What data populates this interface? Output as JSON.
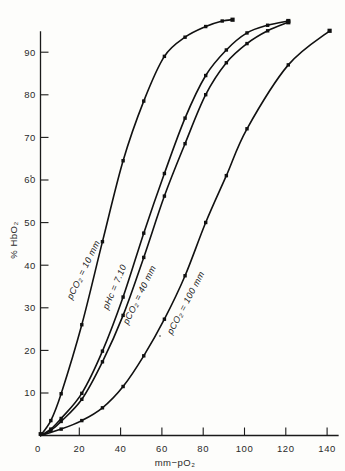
{
  "chart_data": {
    "type": "line",
    "title": "",
    "xlabel": "mm−pO₂",
    "ylabel": "% HbO₂",
    "xlim": [
      0,
      145
    ],
    "ylim": [
      0,
      100
    ],
    "xticks": [
      0,
      20,
      40,
      60,
      80,
      100,
      120,
      140
    ],
    "xtick_labels": [
      "0",
      "20",
      "40",
      "60",
      "80",
      "100",
      "120",
      "140"
    ],
    "yticks": [
      10,
      20,
      30,
      40,
      50,
      60,
      70,
      80,
      90
    ],
    "ytick_labels": [
      "10",
      "20",
      "30",
      "40",
      "50",
      "60",
      "70",
      "80",
      "90"
    ],
    "grid": false,
    "legend_position": "inline-curve-labels",
    "marker": "filled-square",
    "series": [
      {
        "name": "pCO2 = 10 mm",
        "label": "pCO₂ = 10 mm",
        "x": [
          0,
          5,
          10,
          20,
          30,
          40,
          50,
          60,
          70,
          80,
          88,
          93
        ],
        "y": [
          0,
          3.5,
          9.8,
          26.0,
          45.5,
          64.5,
          78.5,
          89.0,
          93.5,
          96.0,
          97.3,
          97.6
        ]
      },
      {
        "name": "pHc = 7.10",
        "label": "pHc = 7.10",
        "x": [
          0,
          5,
          10,
          20,
          30,
          40,
          50,
          60,
          70,
          80,
          90,
          100,
          110,
          120
        ],
        "y": [
          0,
          1.5,
          4.0,
          9.9,
          19.8,
          32.5,
          47.5,
          61.5,
          74.5,
          84.5,
          90.5,
          94.5,
          96.3,
          97.3
        ]
      },
      {
        "name": "pCO2 = 40 mm",
        "label": "pCO₂ = 40 mm",
        "x": [
          0,
          5,
          10,
          20,
          30,
          40,
          50,
          60,
          70,
          80,
          90,
          100,
          110,
          120
        ],
        "y": [
          0,
          1.2,
          3.3,
          8.5,
          17.3,
          28.2,
          41.8,
          56.2,
          68.5,
          80.0,
          87.5,
          92.0,
          95.0,
          97.0
        ]
      },
      {
        "name": "pCO2 = 100 mm",
        "label": "pCO₂ = 100 mm",
        "x": [
          0,
          10,
          20,
          30,
          40,
          50,
          60,
          70,
          80,
          90,
          100,
          120,
          140
        ],
        "y": [
          0,
          1.5,
          3.5,
          6.5,
          11.5,
          18.7,
          27.3,
          37.5,
          50.0,
          61.0,
          72.0,
          87.0,
          95.0
        ]
      }
    ]
  },
  "axes": {
    "x_axis_name": "mm-pO2-axis",
    "y_axis_name": "percent-HbO2-axis"
  }
}
